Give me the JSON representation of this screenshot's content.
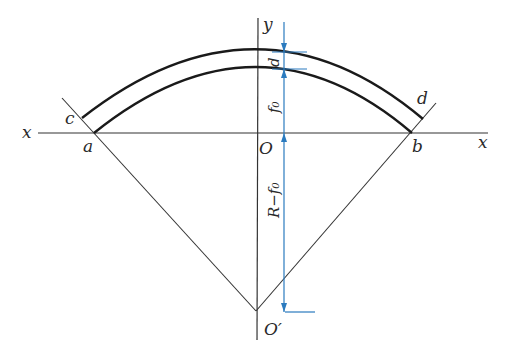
{
  "diagram": {
    "colors": {
      "line": "#222222",
      "dimension": "#2b7bbf",
      "background": "#ffffff"
    },
    "labels": {
      "x_left": "x",
      "x_right": "x",
      "y": "y",
      "a": "a",
      "b": "b",
      "c": "c",
      "d_point": "d",
      "O": "O",
      "O_prime": "O′",
      "thickness": "d",
      "rise": "f₀",
      "radius_minus_rise": "R−f₀"
    },
    "dimensions": [
      {
        "name": "thickness",
        "label": "d",
        "from": "outer-arc-crown",
        "to": "inner-arc-crown"
      },
      {
        "name": "rise",
        "label": "f₀",
        "from": "inner-arc-crown",
        "to": "O"
      },
      {
        "name": "radius-minus-rise",
        "label": "R−f₀",
        "from": "O",
        "to": "O′"
      }
    ]
  }
}
